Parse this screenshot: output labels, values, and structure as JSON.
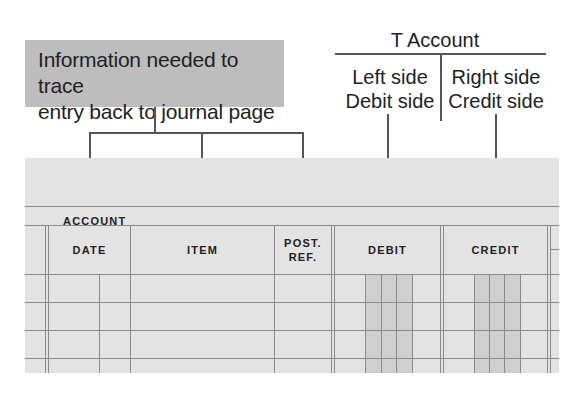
{
  "callout": {
    "line1": "Information needed to trace",
    "line2": "entry back to journal page"
  },
  "t_account": {
    "title": "T Account",
    "left": {
      "line1": "Left side",
      "line2": "Debit side"
    },
    "right": {
      "line1": "Right side",
      "line2": "Credit side"
    }
  },
  "ledger": {
    "account_label": "ACCOUNT",
    "columns": [
      {
        "label": "DATE"
      },
      {
        "label": "ITEM"
      },
      {
        "label": "POST.",
        "label2": "REF."
      },
      {
        "label": "DEBIT"
      },
      {
        "label": "CREDIT"
      }
    ],
    "empty_rows": 4
  }
}
